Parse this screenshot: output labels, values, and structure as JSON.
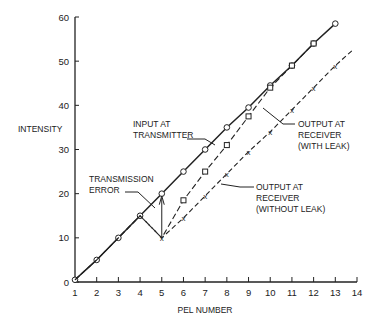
{
  "chart_data": {
    "type": "line",
    "title": "",
    "xlabel": "PEL NUMBER",
    "ylabel": "INTENSITY",
    "xlim": [
      1,
      14
    ],
    "ylim": [
      0,
      60
    ],
    "xticks": [
      1,
      2,
      3,
      4,
      5,
      6,
      7,
      8,
      9,
      10,
      11,
      12,
      13,
      14
    ],
    "yticks": [
      0,
      10,
      20,
      30,
      40,
      50,
      60
    ],
    "grid": false,
    "series": [
      {
        "name": "INPUT AT TRANSMITTER",
        "style": "solid",
        "marker": "circle",
        "x": [
          1,
          2,
          3,
          4,
          5,
          6,
          7,
          8,
          9,
          10,
          11,
          12,
          13
        ],
        "y": [
          0.5,
          5,
          10,
          15,
          20,
          25,
          30,
          35,
          39.5,
          44.5,
          49,
          54,
          58.5
        ]
      },
      {
        "name": "OUTPUT AT RECEIVER (WITH LEAK)",
        "style": "dashed",
        "marker": "square",
        "x": [
          1,
          2,
          3,
          4,
          5,
          6,
          7,
          8,
          9,
          10,
          11,
          12
        ],
        "y": [
          0.5,
          5,
          10,
          15,
          10,
          18.5,
          25,
          31,
          37.5,
          44,
          49,
          54
        ]
      },
      {
        "name": "OUTPUT AT RECEIVER (WITHOUT LEAK)",
        "style": "dash-dot",
        "marker": "x",
        "x": [
          1,
          2,
          3,
          4,
          5,
          6,
          7,
          8,
          9,
          10,
          11,
          12,
          13,
          13.8
        ],
        "y": [
          0.5,
          5,
          10,
          15,
          10,
          14.5,
          19.5,
          24.5,
          29.5,
          34,
          39,
          44,
          49,
          52.5
        ]
      }
    ],
    "annotations": [
      {
        "text": [
          "INPUT AT",
          "TRANSMITTER"
        ]
      },
      {
        "text": [
          "OUTPUT AT",
          "RECEIVER",
          "(WITH LEAK)"
        ]
      },
      {
        "text": [
          "TRANSMISSION",
          "ERROR"
        ]
      },
      {
        "text": [
          "OUTPUT AT",
          "RECEIVER",
          "(WITHOUT LEAK)"
        ]
      }
    ]
  }
}
